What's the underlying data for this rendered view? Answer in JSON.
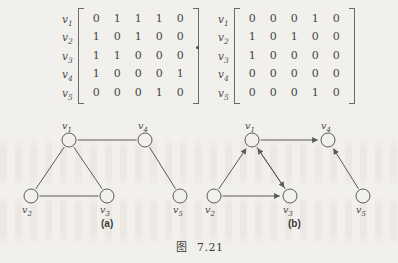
{
  "figure": {
    "caption_prefix": "图",
    "caption_number": "7.21",
    "operator_symbol": "·"
  },
  "matrices": [
    {
      "id": "matrix-a",
      "name": "adjacency-matrix-undirected",
      "row_labels": [
        "v",
        "v",
        "v",
        "v",
        "v"
      ],
      "row_label_subs": [
        "1",
        "2",
        "3",
        "4",
        "5"
      ],
      "rows": [
        [
          "0",
          "1",
          "1",
          "1",
          "0"
        ],
        [
          "1",
          "0",
          "1",
          "0",
          "0"
        ],
        [
          "1",
          "1",
          "0",
          "0",
          "0"
        ],
        [
          "1",
          "0",
          "0",
          "0",
          "1"
        ],
        [
          "0",
          "0",
          "0",
          "1",
          "0"
        ]
      ]
    },
    {
      "id": "matrix-b",
      "name": "adjacency-matrix-directed",
      "row_labels": [
        "v",
        "v",
        "v",
        "v",
        "v"
      ],
      "row_label_subs": [
        "1",
        "2",
        "3",
        "4",
        "5"
      ],
      "rows": [
        [
          "0",
          "0",
          "0",
          "1",
          "0"
        ],
        [
          "1",
          "0",
          "1",
          "0",
          "0"
        ],
        [
          "1",
          "0",
          "0",
          "0",
          "0"
        ],
        [
          "0",
          "0",
          "0",
          "0",
          "0"
        ],
        [
          "0",
          "0",
          "0",
          "1",
          "0"
        ]
      ]
    }
  ],
  "graphs": [
    {
      "id": "graph-a",
      "panel_label": "(a)",
      "directed": false,
      "nodes": [
        {
          "id": "v1",
          "label": "v",
          "sub": "1",
          "x": 69,
          "y": 28,
          "label_x": 62,
          "label_y": 8,
          "label_pos": "above"
        },
        {
          "id": "v2",
          "label": "v",
          "sub": "2",
          "x": 31,
          "y": 84,
          "label_x": 22,
          "label_y": 92,
          "label_pos": "below"
        },
        {
          "id": "v3",
          "label": "v",
          "sub": "3",
          "x": 107,
          "y": 84,
          "label_x": 100,
          "label_y": 92,
          "label_pos": "below"
        },
        {
          "id": "v4",
          "label": "v",
          "sub": "4",
          "x": 145,
          "y": 28,
          "label_x": 138,
          "label_y": 8,
          "label_pos": "above"
        },
        {
          "id": "v5",
          "label": "v",
          "sub": "5",
          "x": 180,
          "y": 84,
          "label_x": 173,
          "label_y": 92,
          "label_pos": "below"
        }
      ],
      "edges": [
        {
          "from": "v1",
          "to": "v2"
        },
        {
          "from": "v1",
          "to": "v3"
        },
        {
          "from": "v1",
          "to": "v4"
        },
        {
          "from": "v2",
          "to": "v3"
        },
        {
          "from": "v4",
          "to": "v5"
        }
      ],
      "panel_label_x": 101,
      "panel_label_y": 218
    },
    {
      "id": "graph-b",
      "panel_label": "(b)",
      "directed": true,
      "nodes": [
        {
          "id": "v1",
          "label": "v",
          "sub": "1",
          "x": 252,
          "y": 28,
          "label_x": 245,
          "label_y": 8,
          "label_pos": "above"
        },
        {
          "id": "v2",
          "label": "v",
          "sub": "2",
          "x": 214,
          "y": 84,
          "label_x": 205,
          "label_y": 92,
          "label_pos": "below"
        },
        {
          "id": "v3",
          "label": "v",
          "sub": "3",
          "x": 290,
          "y": 84,
          "label_x": 283,
          "label_y": 92,
          "label_pos": "below"
        },
        {
          "id": "v4",
          "label": "v",
          "sub": "4",
          "x": 328,
          "y": 28,
          "label_x": 321,
          "label_y": 8,
          "label_pos": "above"
        },
        {
          "id": "v5",
          "label": "v",
          "sub": "5",
          "x": 363,
          "y": 84,
          "label_x": 356,
          "label_y": 92,
          "label_pos": "below"
        }
      ],
      "edges": [
        {
          "from": "v2",
          "to": "v1"
        },
        {
          "from": "v3",
          "to": "v1"
        },
        {
          "from": "v1",
          "to": "v3"
        },
        {
          "from": "v1",
          "to": "v4"
        },
        {
          "from": "v2",
          "to": "v3"
        },
        {
          "from": "v5",
          "to": "v4"
        }
      ],
      "panel_label_x": 288,
      "panel_label_y": 218
    }
  ],
  "style": {
    "ink_color": "#4a4a4a",
    "edge_color": "#5a5a5a",
    "node_radius": 7,
    "background": "#f2f0ec"
  }
}
